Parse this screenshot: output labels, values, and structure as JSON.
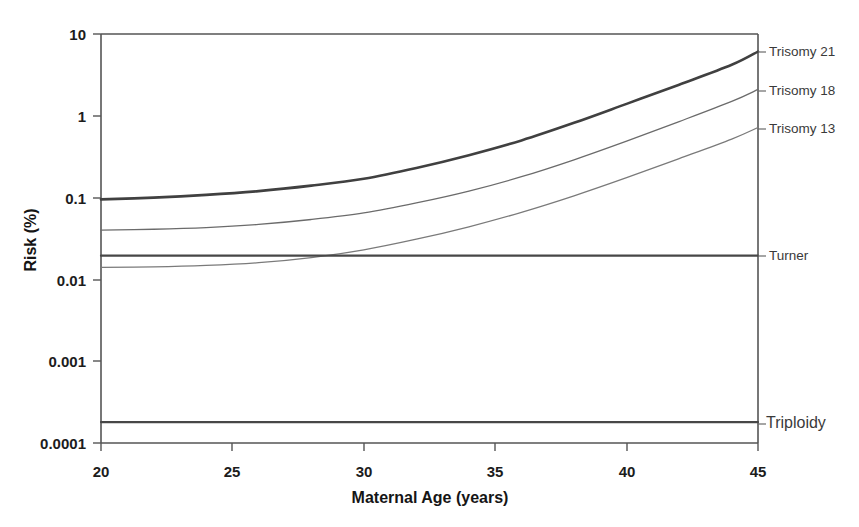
{
  "chart_data": {
    "type": "line",
    "title": "",
    "xlabel": "Maternal Age (years)",
    "ylabel": "Risk (%)",
    "xlim": [
      20,
      45
    ],
    "ylim": [
      0.0001,
      10
    ],
    "yscale": "log",
    "grid": false,
    "legend_position": "right-inline-labels",
    "xticks": [
      "20",
      "25",
      "30",
      "35",
      "40",
      "45"
    ],
    "xtick_values": [
      20,
      25,
      30,
      35,
      40,
      45
    ],
    "yticks": [
      "10",
      "1",
      "0.1",
      "0.01",
      "0.001",
      "0.0001"
    ],
    "ytick_values": [
      10,
      1,
      0.1,
      0.01,
      0.001,
      0.0001
    ],
    "x": [
      20,
      22,
      24,
      26,
      28,
      30,
      32,
      34,
      36,
      38,
      40,
      42,
      44,
      45
    ],
    "series": [
      {
        "name": "Trisomy 21",
        "label": "Trisomy 21",
        "style": "thick-solid",
        "color": "#404040",
        "values": [
          0.095,
          0.1,
          0.108,
          0.12,
          0.14,
          0.17,
          0.23,
          0.33,
          0.5,
          0.82,
          1.4,
          2.4,
          4.2,
          6.1
        ]
      },
      {
        "name": "Trisomy 18",
        "label": "Trisomy 18",
        "style": "thin-solid",
        "color": "#6b6b6b",
        "values": [
          0.04,
          0.041,
          0.043,
          0.047,
          0.054,
          0.065,
          0.086,
          0.12,
          0.18,
          0.29,
          0.49,
          0.85,
          1.5,
          2.1
        ]
      },
      {
        "name": "Trisomy 13",
        "label": "Trisomy 13",
        "style": "thin-solid",
        "color": "#7a7a7a",
        "values": [
          0.014,
          0.0142,
          0.0148,
          0.016,
          0.0185,
          0.023,
          0.031,
          0.044,
          0.066,
          0.105,
          0.175,
          0.3,
          0.52,
          0.72
        ]
      },
      {
        "name": "Turner",
        "label": "Turner",
        "style": "thick-solid-flat",
        "color": "#474747",
        "values": [
          0.0195,
          0.0195,
          0.0195,
          0.0195,
          0.0195,
          0.0195,
          0.0195,
          0.0195,
          0.0195,
          0.0195,
          0.0195,
          0.0195,
          0.0195,
          0.0195
        ]
      },
      {
        "name": "Triploidy",
        "label": "Triploidy",
        "style": "thick-solid-flat",
        "color": "#474747",
        "values": [
          0.00018,
          0.00018,
          0.00018,
          0.00018,
          0.00018,
          0.00018,
          0.00018,
          0.00018,
          0.00018,
          0.00018,
          0.00018,
          0.00018,
          0.00018,
          0.00018
        ]
      }
    ],
    "annotations": [
      {
        "text": "Trisomy 21",
        "at_x": 45,
        "at_y": 6.1
      },
      {
        "text": "Trisomy 18",
        "at_x": 45,
        "at_y": 2.1
      },
      {
        "text": "Trisomy 13",
        "at_x": 45,
        "at_y": 0.72
      },
      {
        "text": "Turner",
        "at_x": 45,
        "at_y": 0.0195
      },
      {
        "text": "Triploidy",
        "at_x": 45,
        "at_y": 0.00018
      }
    ]
  },
  "labels": {
    "y_title": "Risk (%)",
    "x_title": "Maternal Age (years)",
    "y_ticks": {
      "t0": "10",
      "t1": "1",
      "t2": "0.1",
      "t3": "0.01",
      "t4": "0.001",
      "t5": "0.0001"
    },
    "x_ticks": {
      "t0": "20",
      "t1": "25",
      "t2": "30",
      "t3": "35",
      "t4": "40",
      "t5": "45"
    },
    "series_labels": {
      "s0": "Trisomy 21",
      "s1": "Trisomy 18",
      "s2": "Trisomy 13",
      "s3": "Turner",
      "s4": "Triploidy"
    }
  },
  "colors": {
    "background": "#ffffff",
    "axis": "#555555",
    "curve_primary": "#404040",
    "curve_secondary": "#6f6f6f",
    "text": "#1c1c1c"
  }
}
